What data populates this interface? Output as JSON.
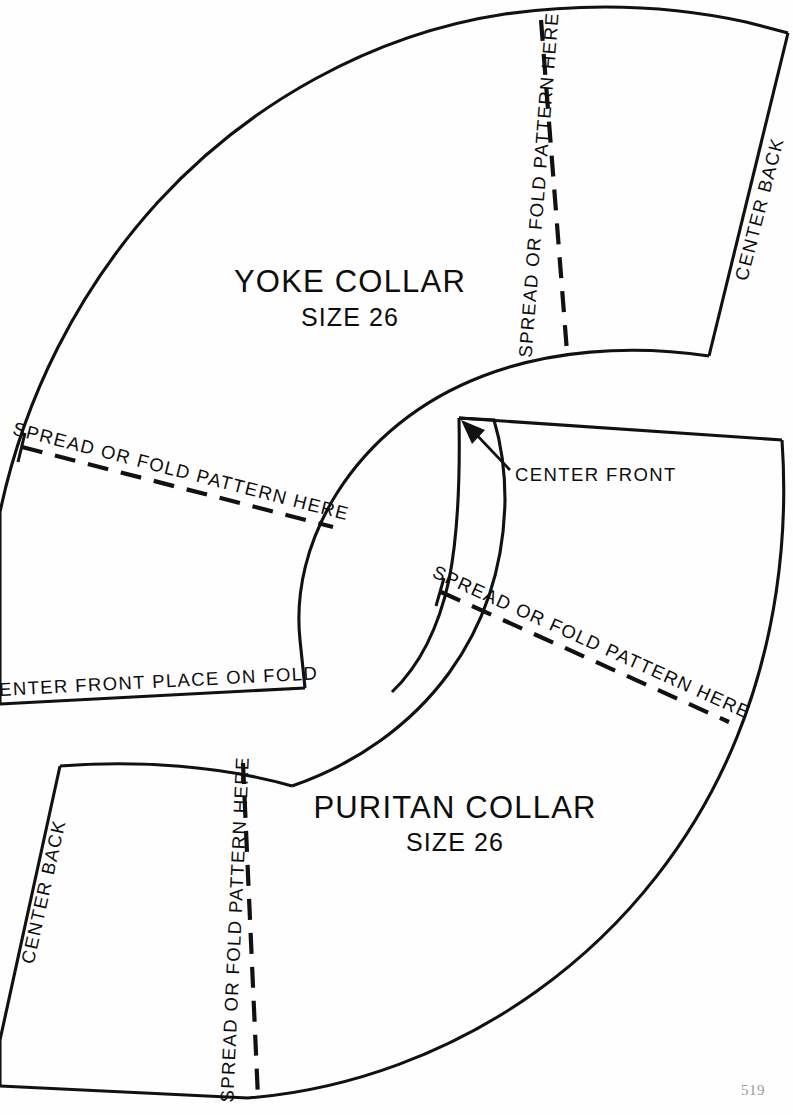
{
  "page": {
    "number": "519",
    "background_color": "#fefefe",
    "ink_color": "#111111",
    "width": 793,
    "height": 1115
  },
  "pieces": [
    {
      "id": "yoke-collar",
      "title": "YOKE COLLAR",
      "size": "SIZE 26",
      "title_position": {
        "x": 350,
        "y": 290
      },
      "size_position": {
        "x": 350,
        "y": 323
      },
      "annotations": [
        {
          "id": "yoke-fold-upper",
          "text": "SPREAD OR FOLD PATTERN HERE",
          "orientation": "vertical-up",
          "line": {
            "x1": 541,
            "y1": 20,
            "x2": 567,
            "y2": 352
          }
        },
        {
          "id": "yoke-fold-left",
          "text": "SPREAD OR FOLD PATTERN HERE",
          "orientation": "diagonal-down-right",
          "line": {
            "x1": 22,
            "y1": 447,
            "x2": 333,
            "y2": 527
          }
        },
        {
          "id": "yoke-center-back",
          "text": "CENTER BACK",
          "orientation": "diagonal-up-right",
          "line": {
            "x1": 709,
            "y1": 355,
            "x2": 786,
            "y2": 57
          }
        },
        {
          "id": "yoke-center-front-fold",
          "text": "CENTER FRONT PLACE ON FOLD",
          "orientation": "horizontal",
          "line": {
            "x1": 0,
            "y1": 703,
            "x2": 305,
            "y2": 688
          }
        }
      ]
    },
    {
      "id": "puritan-collar",
      "title": "PURITAN COLLAR",
      "size": "SIZE 26",
      "title_position": {
        "x": 455,
        "y": 816
      },
      "size_position": {
        "x": 455,
        "y": 848
      },
      "annotations": [
        {
          "id": "puritan-fold-diagonal",
          "text": "SPREAD OR FOLD PATTERN HERE",
          "orientation": "diagonal-down-right",
          "line": {
            "x1": 441,
            "y1": 592,
            "x2": 729,
            "y2": 722
          }
        },
        {
          "id": "puritan-fold-lower",
          "text": "SPREAD OR FOLD PATTERN HERE",
          "orientation": "vertical-up",
          "line": {
            "x1": 243,
            "y1": 763,
            "x2": 258,
            "y2": 1098
          }
        },
        {
          "id": "puritan-center-back",
          "text": "CENTER BACK",
          "orientation": "diagonal-up-right",
          "line": {
            "x1": 5,
            "y1": 1010,
            "x2": 60,
            "y2": 766
          }
        },
        {
          "id": "puritan-center-front",
          "text": "CENTER FRONT",
          "orientation": "horizontal",
          "label_position": {
            "x": 515,
            "y": 481
          },
          "leader": {
            "x1": 505,
            "y1": 466,
            "x2": 463,
            "y2": 423
          }
        }
      ]
    }
  ],
  "labels": {
    "center_front": "CENTER FRONT",
    "center_back": "CENTER BACK",
    "center_front_place_on_fold": "CENTER FRONT PLACE ON FOLD",
    "spread_or_fold": "SPREAD OR FOLD PATTERN HERE"
  }
}
